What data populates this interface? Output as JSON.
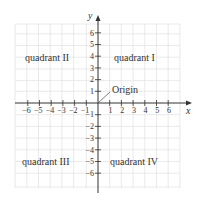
{
  "diagram": {
    "axes": {
      "x_label": "x",
      "y_label": "y",
      "x_ticks": [
        "−6",
        "−5",
        "−4",
        "−3",
        "−2",
        "−1",
        "1",
        "2",
        "3",
        "4",
        "5",
        "6"
      ],
      "y_ticks": [
        "6",
        "5",
        "4",
        "3",
        "2",
        "1",
        "−1",
        "−2",
        "−3",
        "−4",
        "−5",
        "−6"
      ]
    },
    "quadrants": {
      "q1": "quadrant I",
      "q2": "quadrant II",
      "q3": "quadrant III",
      "q4": "quadrant IV"
    },
    "origin_label": "Origin",
    "colors": {
      "grid": "#e2e2e2",
      "axis": "#333333",
      "text": "#333333",
      "background": "#ffffff"
    }
  }
}
